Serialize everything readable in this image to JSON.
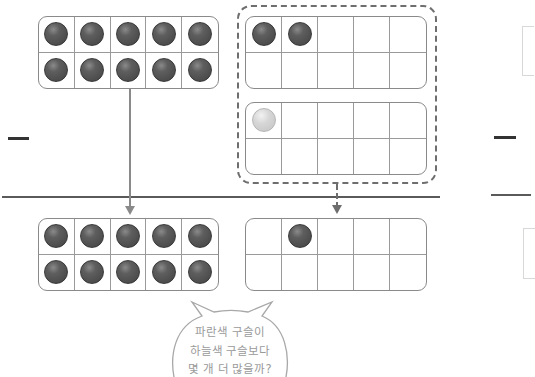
{
  "diagram": {
    "operators": {
      "left_minus": "—",
      "right_minus": "—"
    },
    "top_left_frame": {
      "cells": [
        "dark",
        "dark",
        "dark",
        "dark",
        "dark",
        "dark",
        "dark",
        "dark",
        "dark",
        "dark"
      ],
      "filled_count": 10
    },
    "dashed_group": {
      "frame_a": {
        "cells": [
          "dark",
          "dark",
          "",
          "",
          "",
          "",
          "",
          "",
          "",
          ""
        ],
        "filled_count": 2
      },
      "frame_b": {
        "cells": [
          "light",
          "",
          "",
          "",
          "",
          "",
          "",
          "",
          "",
          ""
        ],
        "filled_count": 1
      }
    },
    "bottom_left_frame": {
      "cells": [
        "dark",
        "dark",
        "dark",
        "dark",
        "dark",
        "dark",
        "dark",
        "dark",
        "dark",
        "dark"
      ],
      "filled_count": 10
    },
    "bottom_right_frame": {
      "cells": [
        "",
        "dark",
        "",
        "",
        "",
        "",
        "",
        "",
        "",
        ""
      ],
      "filled_count": 1
    },
    "speech_bubble": {
      "lines": [
        "파란색 구슬이",
        "하늘색 구슬보다",
        "몇 개 더 많을까?"
      ]
    },
    "colors": {
      "dark_marble": "#4c4c4c",
      "light_marble": "#d0d0d0",
      "frame_border": "#8a8a8a",
      "bubble_text": "#9a9a9a"
    }
  }
}
